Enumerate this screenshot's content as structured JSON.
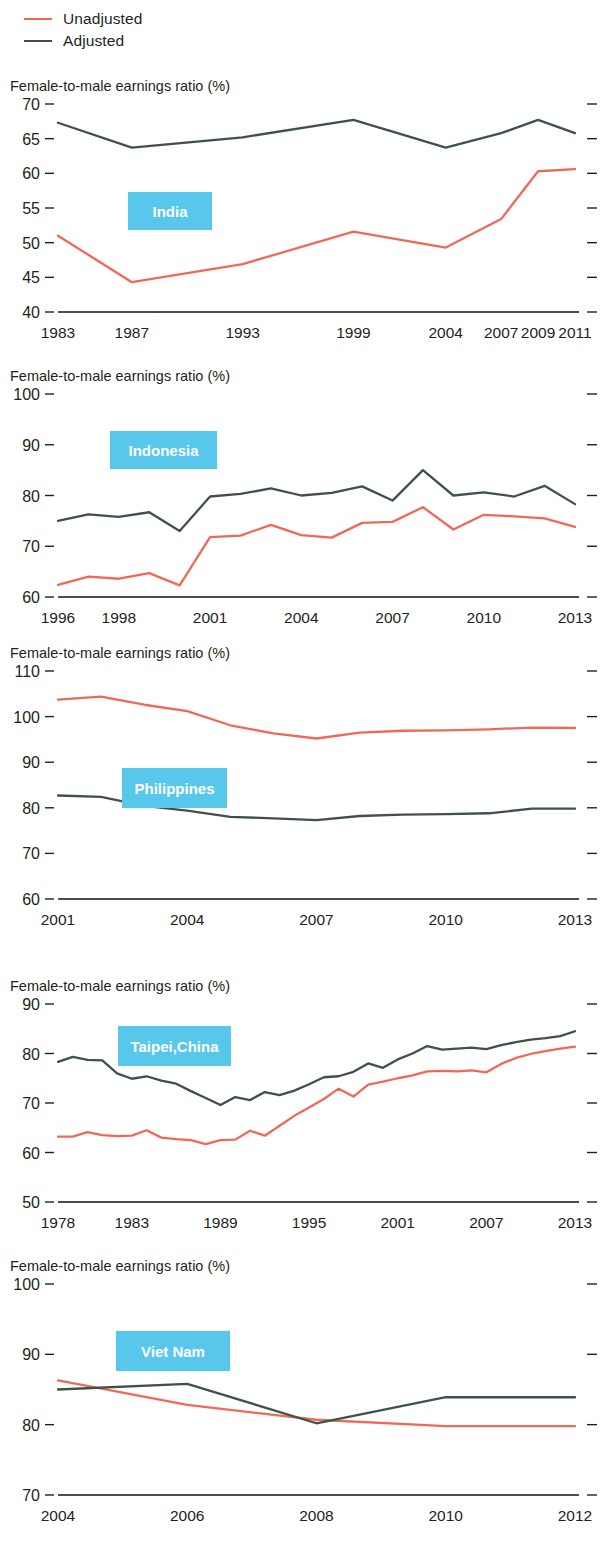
{
  "legend": {
    "items": [
      {
        "label": "Unadjusted",
        "color": "#f0685a",
        "key": "unadjusted"
      },
      {
        "label": "Adjusted",
        "color": "#3f5248",
        "key": "adjusted"
      }
    ]
  },
  "axis_title": "Female-to-male earnings ratio (%)",
  "badge_color": "#57c7ec",
  "chart_data": [
    {
      "type": "line",
      "title": "India",
      "xlabel": "",
      "ylabel": "Female-to-male earnings ratio (%)",
      "ylim": [
        40,
        70
      ],
      "yticks": [
        40,
        45,
        50,
        55,
        60,
        65,
        70
      ],
      "xlim": [
        1983,
        2011
      ],
      "xticks": [
        1983,
        1987,
        1993,
        1999,
        2004,
        2007,
        2009,
        2011
      ],
      "grid": false,
      "legend_position": "top-left (shared)",
      "x": [
        1983,
        1987,
        1993,
        1999,
        2004,
        2007,
        2009,
        2011
      ],
      "series": [
        {
          "name": "Unadjusted",
          "color": "#f0685a",
          "values": [
            51.0,
            44.3,
            46.9,
            51.6,
            49.3,
            53.4,
            60.3,
            60.6
          ]
        },
        {
          "name": "Adjusted",
          "color": "#3f5248",
          "values": [
            67.3,
            63.7,
            65.2,
            67.7,
            63.7,
            65.8,
            67.7,
            65.8
          ]
        }
      ]
    },
    {
      "type": "line",
      "title": "Indonesia",
      "xlabel": "",
      "ylabel": "Female-to-male earnings ratio (%)",
      "ylim": [
        60,
        100
      ],
      "yticks": [
        60,
        70,
        80,
        90,
        100
      ],
      "xlim": [
        1996,
        2013
      ],
      "xticks": [
        1996,
        1998,
        2001,
        2004,
        2007,
        2010,
        2013
      ],
      "grid": false,
      "legend_position": "top-left (shared)",
      "x": [
        1996,
        1997,
        1998,
        1999,
        2000,
        2001,
        2002,
        2003,
        2004,
        2005,
        2006,
        2007,
        2008,
        2009,
        2010,
        2011,
        2012,
        2013
      ],
      "series": [
        {
          "name": "Unadjusted",
          "color": "#f0685a",
          "values": [
            62.4,
            64.0,
            63.6,
            64.7,
            62.3,
            71.8,
            72.1,
            74.2,
            72.2,
            71.7,
            74.6,
            74.8,
            77.7,
            73.3,
            76.2,
            75.9,
            75.5,
            73.8
          ]
        },
        {
          "name": "Adjusted",
          "color": "#3f5248",
          "values": [
            75.0,
            76.3,
            75.8,
            76.7,
            73.0,
            79.8,
            80.3,
            81.4,
            80.0,
            80.5,
            81.8,
            79.0,
            85.0,
            80.0,
            80.6,
            79.8,
            81.9,
            78.3
          ]
        }
      ]
    },
    {
      "type": "line",
      "title": "Philippines",
      "xlabel": "",
      "ylabel": "Female-to-male earnings ratio (%)",
      "ylim": [
        60,
        110
      ],
      "yticks": [
        60,
        70,
        80,
        90,
        100,
        110
      ],
      "xlim": [
        2001,
        2013
      ],
      "xticks": [
        2001,
        2004,
        2007,
        2010,
        2013
      ],
      "grid": false,
      "legend_position": "top-left (shared)",
      "x": [
        2001,
        2002,
        2003,
        2004,
        2005,
        2006,
        2007,
        2008,
        2009,
        2010,
        2011,
        2012,
        2013
      ],
      "series": [
        {
          "name": "Unadjusted",
          "color": "#f0685a",
          "values": [
            103.7,
            104.4,
            102.6,
            101.2,
            98.1,
            96.3,
            95.2,
            96.5,
            96.9,
            97.0,
            97.2,
            97.6,
            97.5
          ]
        },
        {
          "name": "Adjusted",
          "color": "#3f5248",
          "values": [
            82.7,
            82.4,
            80.4,
            79.4,
            78.0,
            77.7,
            77.3,
            78.2,
            78.5,
            78.6,
            78.8,
            79.8,
            79.8
          ]
        }
      ]
    },
    {
      "type": "line",
      "title": "Taipei,China",
      "xlabel": "",
      "ylabel": "Female-to-male earnings ratio (%)",
      "ylim": [
        50,
        90
      ],
      "yticks": [
        50,
        60,
        70,
        80,
        90
      ],
      "xlim": [
        1978,
        2013
      ],
      "xticks": [
        1978,
        1983,
        1989,
        1995,
        2001,
        2007,
        2013
      ],
      "grid": false,
      "legend_position": "top-left (shared)",
      "x": [
        1978,
        1979,
        1980,
        1981,
        1982,
        1983,
        1984,
        1985,
        1986,
        1987,
        1988,
        1989,
        1990,
        1991,
        1992,
        1993,
        1994,
        1995,
        1996,
        1997,
        1998,
        1999,
        2000,
        2001,
        2002,
        2003,
        2004,
        2005,
        2006,
        2007,
        2008,
        2009,
        2010,
        2011,
        2012,
        2013
      ],
      "series": [
        {
          "name": "Unadjusted",
          "color": "#f0685a",
          "values": [
            63.2,
            63.2,
            64.1,
            63.5,
            63.3,
            63.4,
            64.5,
            63.0,
            62.7,
            62.5,
            61.7,
            62.5,
            62.6,
            64.4,
            63.4,
            65.4,
            67.4,
            69.1,
            70.8,
            72.9,
            71.3,
            73.7,
            74.3,
            75.0,
            75.6,
            76.4,
            76.5,
            76.4,
            76.6,
            76.2,
            77.9,
            79.1,
            79.9,
            80.5,
            81.0,
            81.4
          ]
        },
        {
          "name": "Adjusted",
          "color": "#3f5248",
          "values": [
            78.3,
            79.3,
            78.7,
            78.6,
            76.0,
            74.9,
            75.4,
            74.5,
            73.9,
            72.4,
            71.0,
            69.6,
            71.2,
            70.6,
            72.2,
            71.6,
            72.5,
            73.8,
            75.2,
            75.4,
            76.3,
            78.0,
            77.1,
            78.8,
            80.0,
            81.5,
            80.8,
            81.0,
            81.2,
            80.9,
            81.7,
            82.3,
            82.8,
            83.1,
            83.5,
            84.5
          ]
        }
      ]
    },
    {
      "type": "line",
      "title": "Viet Nam",
      "xlabel": "",
      "ylabel": "Female-to-male earnings ratio (%)",
      "ylim": [
        70,
        100
      ],
      "yticks": [
        70,
        80,
        90,
        100
      ],
      "xlim": [
        2004,
        2012
      ],
      "xticks": [
        2004,
        2006,
        2008,
        2010,
        2012
      ],
      "grid": false,
      "legend_position": "top-left (shared)",
      "x": [
        2004,
        2006,
        2008,
        2010,
        2012
      ],
      "series": [
        {
          "name": "Unadjusted",
          "color": "#f0685a",
          "values": [
            86.3,
            82.8,
            80.7,
            79.8,
            79.8
          ]
        },
        {
          "name": "Adjusted",
          "color": "#3f5248",
          "values": [
            85.0,
            85.8,
            80.2,
            83.9,
            83.9
          ]
        }
      ]
    }
  ],
  "panels": [
    {
      "key": "india",
      "top": 78,
      "plot_h": 280
    },
    {
      "key": "indonesia",
      "top": 368,
      "plot_h": 275
    },
    {
      "key": "philippines",
      "top": 645,
      "plot_h": 300
    },
    {
      "key": "taipei",
      "top": 978,
      "plot_h": 270
    },
    {
      "key": "vietnam",
      "top": 1258,
      "plot_h": 283
    }
  ],
  "badges": [
    {
      "label": "India",
      "x": 128,
      "y": 192,
      "w": 84,
      "h": 38
    },
    {
      "label": "Indonesia",
      "x": 110,
      "y": 431,
      "w": 107,
      "h": 38
    },
    {
      "label": "Philippines",
      "x": 122,
      "y": 768,
      "w": 105,
      "h": 40
    },
    {
      "label": "Taipei,China",
      "x": 118,
      "y": 1026,
      "w": 113,
      "h": 40
    },
    {
      "label": "Viet Nam",
      "x": 116,
      "y": 1331,
      "w": 114,
      "h": 40
    }
  ]
}
